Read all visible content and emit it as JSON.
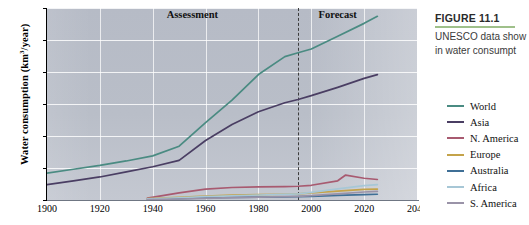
{
  "figure": {
    "title": "FIGURE 11.1",
    "caption_line1": "UNESCO data show",
    "caption_line2": "in water consumpt",
    "rule_color": "#9fc08a"
  },
  "chart_data": {
    "type": "line",
    "title": "",
    "xlabel": "",
    "ylabel": "Water consumption (km3/year)",
    "ylabel_prefix": "Water consumption (km",
    "ylabel_sup": "3",
    "ylabel_suffix": "/year)",
    "xlim": [
      1900,
      2040
    ],
    "ylim": [
      0,
      3000
    ],
    "xticks": [
      1900,
      1920,
      1940,
      1960,
      1980,
      2000,
      2020,
      2040
    ],
    "yticks": [
      0,
      500,
      1000,
      1500,
      2000,
      2500,
      3000
    ],
    "grid": true,
    "legend_position": "right",
    "annotations": [
      {
        "text": "Assessment",
        "x": 1955,
        "y": 2870
      },
      {
        "text": "Forecast",
        "x": 2010,
        "y": 2870
      }
    ],
    "divider": {
      "x": 1995,
      "style": "dashed",
      "color": "#3c3c3c"
    },
    "series": [
      {
        "name": "World",
        "color": "#4a8b82",
        "x": [
          1900,
          1910,
          1920,
          1930,
          1940,
          1950,
          1960,
          1970,
          1980,
          1990,
          1995,
          2000,
          2010,
          2020,
          2025
        ],
        "values": [
          420,
          480,
          540,
          610,
          690,
          840,
          1210,
          1560,
          1960,
          2240,
          2300,
          2360,
          2560,
          2760,
          2870
        ]
      },
      {
        "name": "Asia",
        "color": "#4a3e63",
        "x": [
          1900,
          1910,
          1920,
          1930,
          1940,
          1950,
          1960,
          1970,
          1980,
          1990,
          1995,
          2000,
          2010,
          2020,
          2025
        ],
        "values": [
          240,
          300,
          360,
          440,
          520,
          620,
          930,
          1180,
          1380,
          1520,
          1570,
          1630,
          1760,
          1900,
          1960
        ]
      },
      {
        "name": "N. America",
        "color": "#a85a70",
        "x": [
          1938,
          1950,
          1960,
          1970,
          1980,
          1990,
          1995,
          2000,
          2010,
          2013,
          2020,
          2025
        ],
        "values": [
          30,
          110,
          170,
          195,
          205,
          210,
          215,
          230,
          300,
          390,
          340,
          320
        ]
      },
      {
        "name": "Europe",
        "color": "#c4a34a",
        "x": [
          1938,
          1950,
          1960,
          1970,
          1980,
          1990,
          1995,
          2000,
          2010,
          2020,
          2025
        ],
        "values": [
          20,
          40,
          60,
          75,
          85,
          90,
          95,
          110,
          140,
          165,
          170
        ]
      },
      {
        "name": "Australia",
        "color": "#3f6f96",
        "x": [
          1938,
          1950,
          1960,
          1970,
          1980,
          1990,
          1995,
          2000,
          2010,
          2020,
          2025
        ],
        "values": [
          12,
          22,
          32,
          40,
          45,
          50,
          52,
          58,
          72,
          85,
          90
        ]
      },
      {
        "name": "Africa",
        "color": "#a7c7d6",
        "x": [
          1938,
          1950,
          1960,
          1970,
          1980,
          1990,
          1995,
          2000,
          2010,
          2020,
          2025
        ],
        "values": [
          18,
          35,
          52,
          66,
          78,
          88,
          95,
          120,
          175,
          225,
          240
        ]
      },
      {
        "name": "S. America",
        "color": "#9a93a8",
        "x": [
          1938,
          1950,
          1960,
          1970,
          1980,
          1990,
          1995,
          2000,
          2010,
          2020,
          2025
        ],
        "values": [
          8,
          16,
          26,
          36,
          44,
          52,
          56,
          68,
          95,
          125,
          135
        ]
      }
    ]
  },
  "legend": {
    "items": [
      {
        "label": "World",
        "color": "#4a8b82"
      },
      {
        "label": "Asia",
        "color": "#4a3e63"
      },
      {
        "label": "N. America",
        "color": "#a85a70"
      },
      {
        "label": "Europe",
        "color": "#c4a34a"
      },
      {
        "label": "Australia",
        "color": "#3f6f96"
      },
      {
        "label": "Africa",
        "color": "#a7c7d6"
      },
      {
        "label": "S. America",
        "color": "#9a93a8"
      }
    ]
  }
}
